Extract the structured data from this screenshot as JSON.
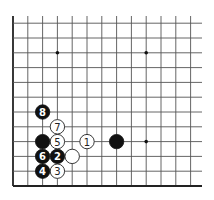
{
  "diagram": {
    "type": "go-board-corner",
    "corner": "bottom-left",
    "grid": {
      "origin_x": 13,
      "origin_y": 186,
      "spacing": 14.8,
      "columns": 13,
      "rows": 12,
      "line_color": "#555555",
      "edge_color": "#222222"
    },
    "star_points": [
      {
        "col": 3,
        "row": 9
      },
      {
        "col": 9,
        "row": 9
      },
      {
        "col": 9,
        "row": 3
      }
    ],
    "stones": [
      {
        "color": "white",
        "col": 5,
        "row": 3,
        "label": "1"
      },
      {
        "color": "black",
        "col": 3,
        "row": 2,
        "label": "2"
      },
      {
        "color": "white",
        "col": 3,
        "row": 1,
        "label": "3"
      },
      {
        "color": "black",
        "col": 2,
        "row": 1,
        "label": "4"
      },
      {
        "color": "white",
        "col": 3,
        "row": 3,
        "label": "5"
      },
      {
        "color": "black",
        "col": 2,
        "row": 2,
        "label": "6"
      },
      {
        "color": "white",
        "col": 3,
        "row": 4,
        "label": "7"
      },
      {
        "color": "black",
        "col": 2,
        "row": 5,
        "label": "8"
      },
      {
        "color": "black",
        "col": 2,
        "row": 3,
        "label": ""
      },
      {
        "color": "white",
        "col": 4,
        "row": 2,
        "label": ""
      },
      {
        "color": "black",
        "col": 7,
        "row": 3,
        "label": ""
      }
    ]
  }
}
